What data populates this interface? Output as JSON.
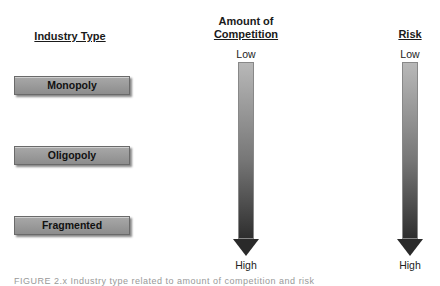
{
  "headers": {
    "industry_type": "Industry Type",
    "competition_line1": "Amount of",
    "competition_line2": "Competition",
    "risk": "Risk"
  },
  "industry_types": [
    {
      "label": "Monopoly"
    },
    {
      "label": "Oligopoly"
    },
    {
      "label": "Fragmented"
    }
  ],
  "scales": {
    "competition": {
      "top_label": "Low",
      "bottom_label": "High"
    },
    "risk": {
      "top_label": "Low",
      "bottom_label": "High"
    }
  },
  "caption": "FIGURE 2.x  Industry type related to amount of competition and risk"
}
